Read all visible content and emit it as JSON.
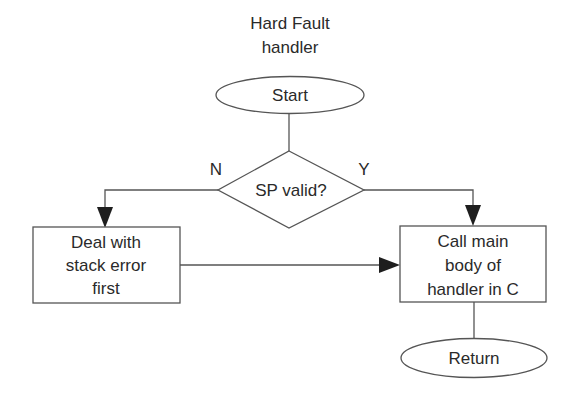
{
  "diagram": {
    "title_line1": "Hard Fault",
    "title_line2": "handler",
    "nodes": {
      "start": {
        "type": "terminator",
        "label": "Start"
      },
      "decision": {
        "type": "decision",
        "label": "SP valid?"
      },
      "deal_stack_error": {
        "type": "process",
        "lines": [
          "Deal with",
          "stack error",
          "first"
        ]
      },
      "call_main_body": {
        "type": "process",
        "lines": [
          "Call main",
          "body of",
          "handler in C"
        ]
      },
      "return": {
        "type": "terminator",
        "label": "Return"
      }
    },
    "edges": [
      {
        "from": "start",
        "to": "decision",
        "label": ""
      },
      {
        "from": "decision",
        "to": "deal_stack_error",
        "label": "N"
      },
      {
        "from": "decision",
        "to": "call_main_body",
        "label": "Y"
      },
      {
        "from": "deal_stack_error",
        "to": "call_main_body",
        "label": ""
      },
      {
        "from": "call_main_body",
        "to": "return",
        "label": ""
      }
    ],
    "labels": {
      "no": "N",
      "yes": "Y"
    },
    "colors": {
      "background": "#ffffff",
      "stroke": "#555555",
      "text": "#2a2a2a",
      "arrowhead": "#1e1e1e"
    }
  }
}
